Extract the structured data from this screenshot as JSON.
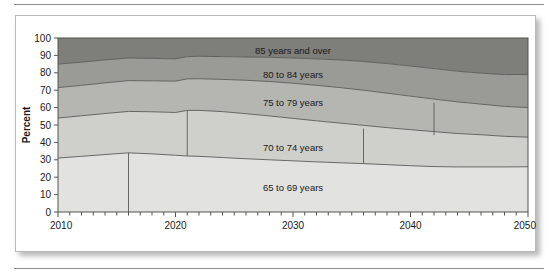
{
  "figure": {
    "type": "stacked-area-chart",
    "frame_visible": true
  },
  "chart_data": {
    "type": "area",
    "stacked": true,
    "title": "",
    "subtitle": "",
    "xlabel": "",
    "ylabel": "Percent",
    "xlim": [
      2010,
      2050
    ],
    "ylim": [
      0,
      100
    ],
    "grid": false,
    "legend_position": "inline-labels",
    "x_tick_interval": 1,
    "x_label_interval": 10,
    "y_tick_interval": 10,
    "x_tick_labels": [
      "2010",
      "2020",
      "2030",
      "2040",
      "2050"
    ],
    "y_tick_labels": [
      "0",
      "10",
      "20",
      "30",
      "40",
      "50",
      "60",
      "70",
      "80",
      "90",
      "100"
    ],
    "x": [
      2010,
      2012,
      2014,
      2016,
      2018,
      2020,
      2021,
      2022,
      2024,
      2026,
      2028,
      2030,
      2032,
      2034,
      2036,
      2038,
      2040,
      2042,
      2044,
      2046,
      2048,
      2050
    ],
    "series": [
      {
        "name": "65 to 69 years",
        "color": "#e2e2e0",
        "label_x": 2030,
        "label_y": 14,
        "values": [
          31.0,
          32.0,
          33.0,
          34.0,
          33.4,
          32.6,
          32.2,
          32.0,
          31.3,
          30.6,
          30.0,
          29.4,
          28.8,
          28.3,
          27.8,
          27.2,
          26.6,
          26.1,
          25.9,
          25.9,
          25.9,
          26.0
        ]
      },
      {
        "name": "70 to 74 years",
        "color": "#cfcfcc",
        "label_x": 2030,
        "label_y": 37,
        "values": [
          23.0,
          23.3,
          23.6,
          23.8,
          24.2,
          24.6,
          26.2,
          26.4,
          26.4,
          25.9,
          25.2,
          24.4,
          23.6,
          22.8,
          22.0,
          21.3,
          20.7,
          20.1,
          19.2,
          18.5,
          17.6,
          17.0
        ]
      },
      {
        "name": "75 to 79 years",
        "color": "#b5b5b2",
        "label_x": 2030,
        "label_y": 63,
        "values": [
          17.5,
          17.5,
          17.6,
          17.7,
          17.8,
          18.0,
          18.1,
          18.2,
          18.5,
          19.2,
          19.8,
          20.2,
          20.4,
          20.4,
          20.2,
          19.8,
          19.3,
          18.7,
          18.2,
          17.6,
          17.2,
          17.0
        ]
      },
      {
        "name": "80 to 84 years",
        "color": "#9a9a97",
        "label_x": 2030,
        "label_y": 79,
        "values": [
          13.5,
          13.3,
          13.2,
          13.0,
          12.9,
          12.8,
          12.8,
          12.9,
          13.1,
          13.4,
          13.9,
          14.5,
          15.2,
          15.9,
          16.5,
          17.0,
          17.3,
          17.5,
          17.6,
          17.8,
          18.3,
          19.0
        ]
      },
      {
        "name": "85 years and over",
        "color": "#7e7e7b",
        "label_x": 2030,
        "label_y": 93,
        "values": [
          15.0,
          13.9,
          12.6,
          11.5,
          11.7,
          12.0,
          10.7,
          10.5,
          10.7,
          10.9,
          11.1,
          11.5,
          12.0,
          12.6,
          13.5,
          14.7,
          16.1,
          17.6,
          19.1,
          20.2,
          21.0,
          21.0
        ]
      }
    ],
    "vertical_markers": [
      {
        "x": 2016,
        "from": 0,
        "to": 34.0
      },
      {
        "x": 2021,
        "from": 32.2,
        "to": 58.4
      },
      {
        "x": 2036,
        "from": 27.8,
        "to": 48.0
      },
      {
        "x": 2042,
        "from": 44.2,
        "to": 62.9
      }
    ]
  }
}
